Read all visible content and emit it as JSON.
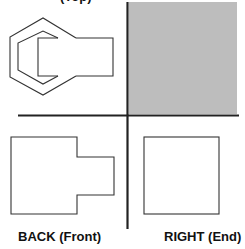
{
  "diagram": {
    "type": "orthographic-projection",
    "colors": {
      "line": "#222222",
      "shade": "#bdbdbd",
      "background": "#ffffff"
    },
    "views": [
      {
        "id": "top",
        "label": "TOP (Top)",
        "label_visible": "partially cropped",
        "shape": "hexagon with rectangular prong"
      },
      {
        "id": "shaded",
        "label": "",
        "shape": "gray filled quadrant"
      },
      {
        "id": "back",
        "label": "BACK (Front)",
        "shape": "stepped rectangle"
      },
      {
        "id": "right",
        "label": "RIGHT (End)",
        "shape": "square"
      }
    ]
  },
  "labels": {
    "top": "(Top)",
    "back": "BACK (Front)",
    "right": "RIGHT (End)"
  }
}
